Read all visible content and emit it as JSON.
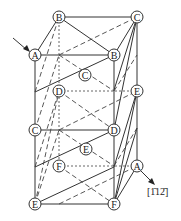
{
  "diagram": {
    "title": "",
    "direction_label": "[1̄12̄]",
    "nodes": [
      {
        "id": "n1",
        "label": "B",
        "x": 59,
        "y": 17
      },
      {
        "id": "n2",
        "label": "C",
        "x": 137,
        "y": 17
      },
      {
        "id": "n3",
        "label": "A",
        "x": 35,
        "y": 55
      },
      {
        "id": "n4",
        "label": "B",
        "x": 114,
        "y": 55
      },
      {
        "id": "n5",
        "label": "C",
        "x": 85,
        "y": 75
      },
      {
        "id": "n6",
        "label": "D",
        "x": 59,
        "y": 91
      },
      {
        "id": "n7",
        "label": "E",
        "x": 137,
        "y": 91
      },
      {
        "id": "n8",
        "label": "C",
        "x": 35,
        "y": 130
      },
      {
        "id": "n9",
        "label": "D",
        "x": 114,
        "y": 130
      },
      {
        "id": "n10",
        "label": "E",
        "x": 86,
        "y": 149
      },
      {
        "id": "n11",
        "label": "F",
        "x": 59,
        "y": 166
      },
      {
        "id": "n12",
        "label": "A",
        "x": 137,
        "y": 166
      },
      {
        "id": "n13",
        "label": "E",
        "x": 35,
        "y": 204
      },
      {
        "id": "n14",
        "label": "F",
        "x": 114,
        "y": 204
      }
    ],
    "line_color": "#333333",
    "background": "#ffffff"
  }
}
